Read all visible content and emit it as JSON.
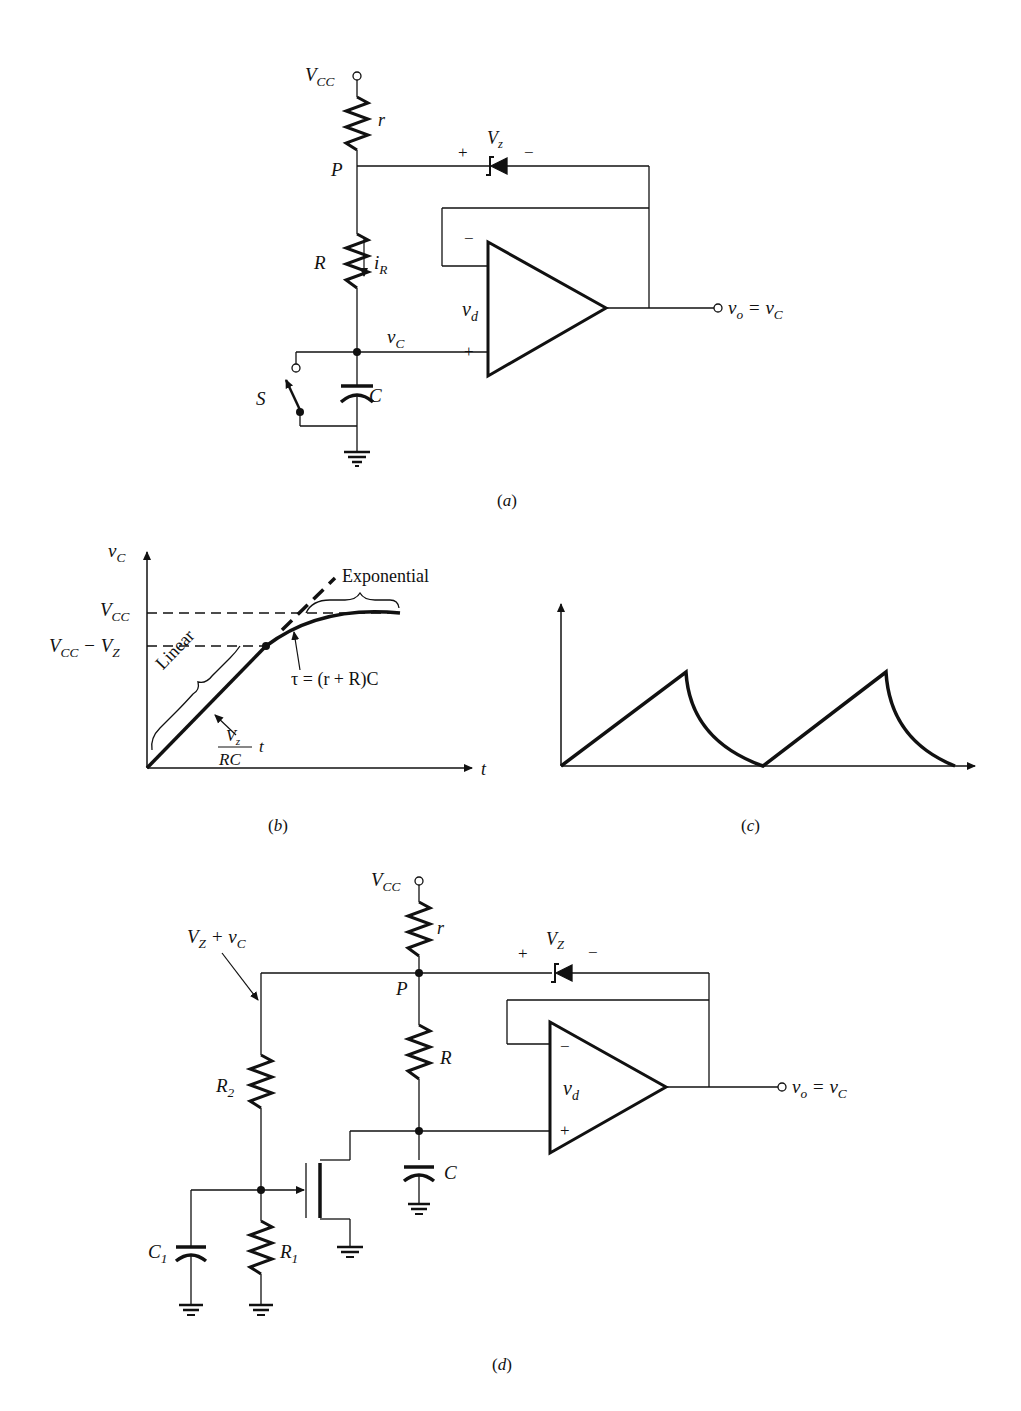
{
  "page": {
    "header_fragment": "(cropped running header text at top right)"
  },
  "figure_a": {
    "caption": "(a)",
    "labels": {
      "vcc": "V",
      "vcc_sub": "CC",
      "r": "r",
      "p": "P",
      "zener_plus": "+",
      "zener_v": "V",
      "zener_sub": "z",
      "zener_minus": "−",
      "R": "R",
      "iR": "i",
      "iR_sub": "R",
      "opamp_minus": "−",
      "opamp_plus": "+",
      "vd": "v",
      "vd_sub": "d",
      "vC": "v",
      "vC_sub": "C",
      "S": "S",
      "C": "C",
      "vo_eq": "v",
      "vo_sub": "o",
      "vo_equals": " = v",
      "vo_rhs_sub": "C"
    }
  },
  "figure_b": {
    "caption": "(b)",
    "labels": {
      "y_axis": "v",
      "y_axis_sub": "C",
      "x_axis": "t",
      "vcc": "V",
      "vcc_sub": "CC",
      "vcc_minus_vz": "V",
      "vcc_minus_vz_sub1": "CC",
      "vcc_minus_vz_mid": " − V",
      "vcc_minus_vz_sub2": "Z",
      "exponential": "Exponential",
      "linear": "Linear",
      "tau": "τ = (r + R)C",
      "slope_num": "V",
      "slope_num_sub": "z",
      "slope_den": "RC",
      "slope_t": "t"
    }
  },
  "figure_c": {
    "caption": "(c)"
  },
  "figure_d": {
    "caption": "(d)",
    "labels": {
      "vcc": "V",
      "vcc_sub": "CC",
      "r": "r",
      "p": "P",
      "vz_plus_vc": "V",
      "vz_plus_vc_sub": "Z",
      "vz_plus_vc_mid": " + v",
      "vz_plus_vc_sub2": "C",
      "zener_plus": "+",
      "zener_v": "V",
      "zener_sub": "Z",
      "zener_minus": "−",
      "R": "R",
      "R2": "R",
      "R2_sub": "2",
      "R1": "R",
      "R1_sub": "1",
      "C": "C",
      "C1": "C",
      "C1_sub": "1",
      "opamp_minus": "−",
      "opamp_plus": "+",
      "vd": "v",
      "vd_sub": "d",
      "vo_eq": "v",
      "vo_sub": "o",
      "vo_equals": " = v",
      "vo_rhs_sub": "C"
    }
  },
  "colors": {
    "ink": "#111111",
    "paper": "#ffffff"
  }
}
